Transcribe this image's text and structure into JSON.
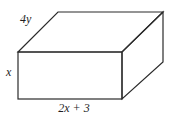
{
  "figure": {
    "labels": {
      "depth": "4y",
      "height": "x",
      "width": "2x + 3"
    },
    "line_color": "#2b2b2b",
    "background_color": "#ffffff"
  }
}
